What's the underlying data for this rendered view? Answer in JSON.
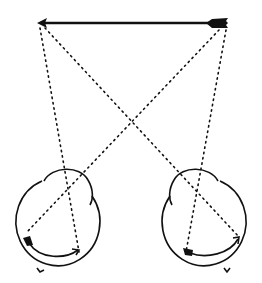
{
  "diagram": {
    "colors": {
      "ink": "#111111",
      "background": "#ffffff"
    },
    "object": {
      "name": "arrow",
      "head": [
        38,
        23
      ],
      "tail": [
        228,
        23
      ],
      "direction": "left"
    },
    "eyes": [
      {
        "name": "left-eye",
        "center": [
          54,
          230
        ],
        "radius": 41,
        "cornea_side": "right"
      },
      {
        "name": "right-eye",
        "center": [
          206,
          230
        ],
        "radius": 41,
        "cornea_side": "left"
      }
    ],
    "rays": [
      {
        "from": "arrow-head",
        "to": "left-eye",
        "points": [
          [
            40,
            28
          ],
          [
            79,
            252
          ]
        ]
      },
      {
        "from": "arrow-head",
        "to": "right-eye",
        "points": [
          [
            45,
            28
          ],
          [
            239,
            237
          ]
        ]
      },
      {
        "from": "arrow-tail",
        "to": "left-eye",
        "points": [
          [
            219,
            30
          ],
          [
            27,
            232
          ]
        ]
      },
      {
        "from": "arrow-tail",
        "to": "right-eye",
        "points": [
          [
            226,
            30
          ],
          [
            186,
            252
          ]
        ]
      }
    ],
    "retinal_images": [
      {
        "eye": "left-eye",
        "tail_at": [
          27,
          239
        ],
        "head_at": [
          79,
          250
        ]
      },
      {
        "eye": "right-eye",
        "tail_at": [
          189,
          252
        ],
        "head_at": [
          239,
          237
        ]
      }
    ]
  }
}
